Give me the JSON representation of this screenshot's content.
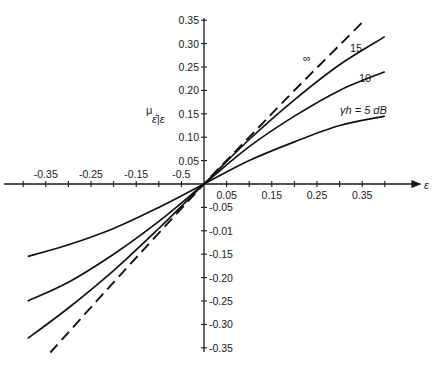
{
  "chart_data": {
    "type": "line",
    "title": "",
    "xlabel": "ε",
    "ylabel": "μ ε̂|ε",
    "xlim": [
      -0.4,
      0.4
    ],
    "ylim": [
      -0.35,
      0.35
    ],
    "grid": false,
    "legend": "inline labels on curves",
    "x_tick_labels": [
      "-0.35",
      "-0.25",
      "-0.15",
      "-0.5",
      "0.05",
      "0.15",
      "0.25",
      "0.35"
    ],
    "x_tick_positions": [
      -0.35,
      -0.25,
      -0.15,
      -0.05,
      0.05,
      0.15,
      0.25,
      0.35
    ],
    "y_tick_labels_pos": [
      "0.35",
      "0.30",
      "0.25",
      "0.20",
      "0.15",
      "0.10",
      "0.05"
    ],
    "y_tick_labels_neg": [
      "-0.05",
      "-0.01",
      "-0.15",
      "-0.20",
      "-0.25",
      "-0.30",
      "-0.35"
    ],
    "series": [
      {
        "name": "∞",
        "style": "dashed",
        "x": [
          -0.34,
          -0.2,
          -0.1,
          0,
          0.1,
          0.2,
          0.35
        ],
        "y": [
          -0.36,
          -0.21,
          -0.105,
          0,
          0.1,
          0.2,
          0.345
        ]
      },
      {
        "name": "15",
        "style": "solid",
        "x": [
          -0.39,
          -0.3,
          -0.2,
          -0.1,
          0,
          0.1,
          0.2,
          0.3,
          0.4
        ],
        "y": [
          -0.33,
          -0.265,
          -0.185,
          -0.095,
          0,
          0.095,
          0.18,
          0.255,
          0.315
        ]
      },
      {
        "name": "10",
        "style": "solid",
        "x": [
          -0.39,
          -0.3,
          -0.2,
          -0.1,
          0,
          0.1,
          0.2,
          0.3,
          0.4
        ],
        "y": [
          -0.25,
          -0.21,
          -0.15,
          -0.08,
          0,
          0.08,
          0.145,
          0.2,
          0.24
        ]
      },
      {
        "name": "γh = 5 dB",
        "style": "solid",
        "x": [
          -0.39,
          -0.3,
          -0.2,
          -0.1,
          0,
          0.1,
          0.2,
          0.3,
          0.4
        ],
        "y": [
          -0.155,
          -0.13,
          -0.095,
          -0.05,
          0,
          0.05,
          0.09,
          0.125,
          0.145
        ]
      }
    ],
    "annotations": [
      {
        "text": "∞",
        "near_series": "∞"
      },
      {
        "text": "15",
        "near_series": "15"
      },
      {
        "text": "10",
        "near_series": "10"
      },
      {
        "text": "γh = 5 dB",
        "near_series": "γh = 5 dB"
      }
    ]
  },
  "labels": {
    "x_axis": "ε",
    "y_axis_mu": "μ",
    "y_axis_sub": "ε̂|ε",
    "inf": "∞",
    "c15": "15",
    "c10": "10",
    "c5": "γh = 5 dB"
  }
}
